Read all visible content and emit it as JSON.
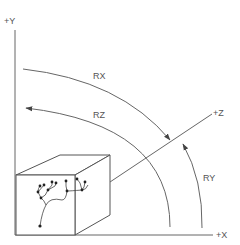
{
  "diagram": {
    "axes": {
      "x_label": "+X",
      "y_label": "+Y",
      "z_label": "+Z"
    },
    "rotations": {
      "rx_label": "RX",
      "ry_label": "RY",
      "rz_label": "RZ"
    },
    "object": "cube-containing-neuron",
    "colors": {
      "line": "#666666",
      "text": "#555555",
      "background": "#ffffff"
    }
  }
}
